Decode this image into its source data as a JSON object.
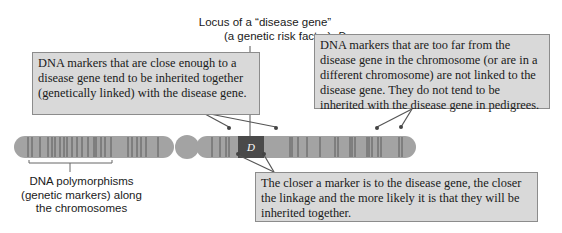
{
  "locus_label": {
    "line1": "Locus of a “disease gene”",
    "line2_prefix": "(a genetic risk factor), ",
    "line2_symbol": "D"
  },
  "gene_symbol": "D",
  "callouts": {
    "close_markers": "DNA markers that are close enough to a disease gene tend to be inherited together (genetically linked) with the disease gene.",
    "far_markers": "DNA markers that are too far from the disease gene in the chromosome (or are in a different chromosome) are not linked to the disease gene. They do not tend to be inherited with the disease gene in pedigrees.",
    "closer_linkage": "The closer a marker is to the disease gene, the closer the linkage and the more likely it is that they will be inherited together."
  },
  "polymorphism_label": {
    "line1": "DNA polymorphisms",
    "line2": "(genetic markers) along",
    "line3": "the chromosomes"
  },
  "colors": {
    "chromosome": "#a3a3a3",
    "band": "#5a5a5a",
    "disease_locus": "#4a4a4a",
    "callout_bg": "#d9d9d9",
    "leader": "#555555"
  }
}
